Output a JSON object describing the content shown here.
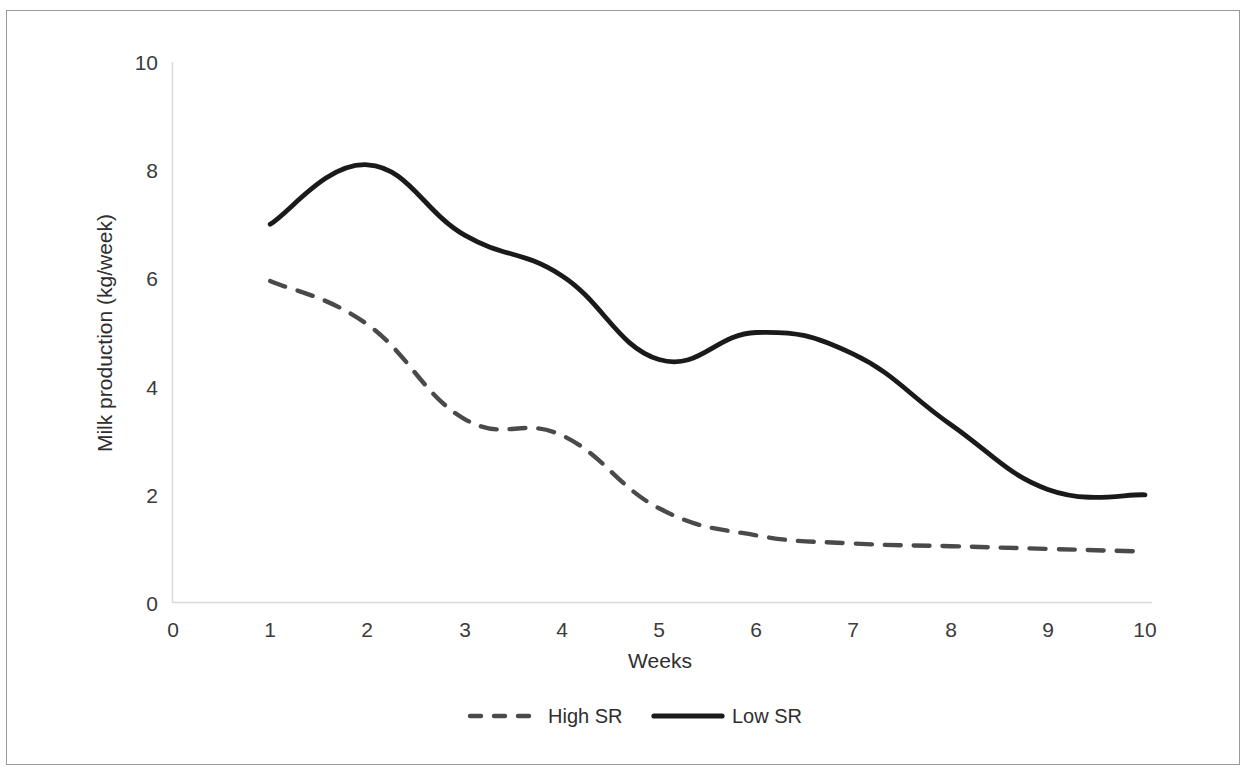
{
  "chart_data": {
    "type": "line",
    "title": "",
    "xlabel": "Weeks",
    "ylabel": "Milk production (kg/week)",
    "x": [
      1,
      2,
      3,
      4,
      5,
      6,
      7,
      8,
      9,
      10
    ],
    "xlim": [
      0,
      10
    ],
    "ylim": [
      0,
      10
    ],
    "xticks": [
      "0",
      "1",
      "2",
      "3",
      "4",
      "5",
      "6",
      "7",
      "8",
      "9",
      "10"
    ],
    "yticks": [
      "0",
      "2",
      "4",
      "6",
      "8",
      "10"
    ],
    "grid": false,
    "legend_position": "bottom-center",
    "series": [
      {
        "name": "High SR",
        "style": "dashed",
        "color": "#4a4a4a",
        "values": [
          5.95,
          5.15,
          3.4,
          3.1,
          1.75,
          1.25,
          1.1,
          1.05,
          1.0,
          0.95
        ]
      },
      {
        "name": "Low SR",
        "style": "solid",
        "color": "#1a1a1a",
        "values": [
          7.0,
          8.1,
          6.8,
          6.05,
          4.5,
          5.0,
          4.6,
          3.3,
          2.1,
          2.0
        ]
      }
    ]
  },
  "axes": {
    "y_title": "Milk production (kg/week)",
    "x_title": "Weeks",
    "y_tick_labels": [
      "10",
      "8",
      "6",
      "4",
      "2",
      "0"
    ],
    "x_tick_labels": [
      "0",
      "1",
      "2",
      "3",
      "4",
      "5",
      "6",
      "7",
      "8",
      "9",
      "10"
    ]
  },
  "legend": {
    "items": [
      {
        "label": "High SR",
        "style": "dashed"
      },
      {
        "label": "Low SR",
        "style": "solid"
      }
    ]
  }
}
